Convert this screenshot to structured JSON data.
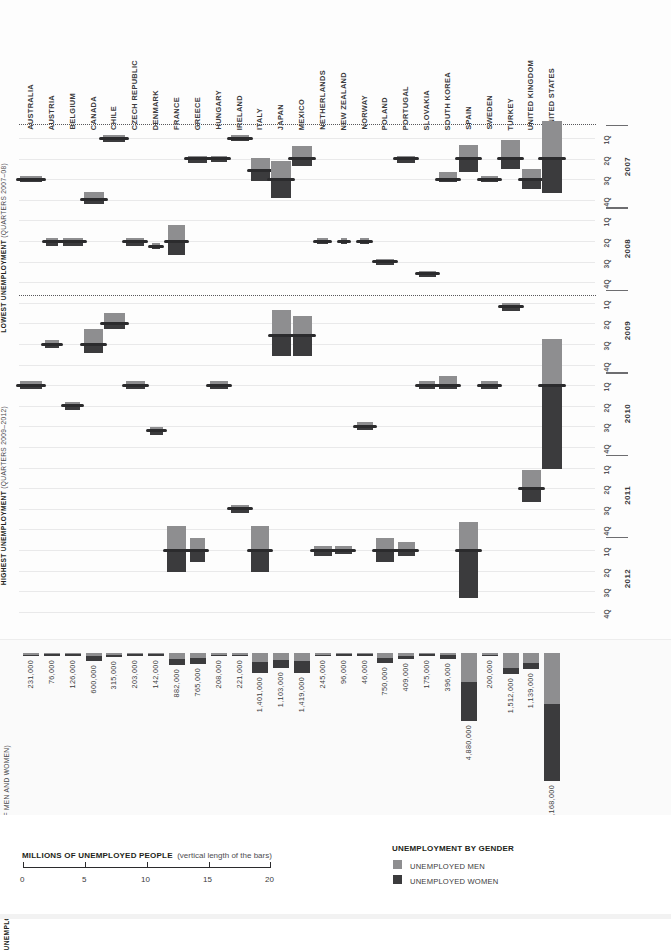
{
  "meta": {
    "colors": {
      "men": "#8e8e90",
      "women": "#3b3b3d",
      "grid": "#e9e9ea",
      "text": "#231f20"
    }
  },
  "left_captions": {
    "lowest_title": "LOWEST UNEMPLOYMENT",
    "lowest_sub": "(QUARTERS 2007–08)",
    "highest_title": "HIGHEST UNEMPLOYMENT",
    "highest_sub": "(QUARTERS 2009–2012)"
  },
  "countries": [
    "AUSTRALIA",
    "AUSTRIA",
    "BELGIUM",
    "CANADA",
    "CHILE",
    "CZECH REPUBLIC",
    "DENMARK",
    "FRANCE",
    "GREECE",
    "HUNGARY",
    "IRELAND",
    "ITALY",
    "JAPAN",
    "MEXICO",
    "NETHERLANDS",
    "NEW ZEALAND",
    "NORWAY",
    "POLAND",
    "PORTUGAL",
    "SLOVAKIA",
    "SOUTH KOREA",
    "SPAIN",
    "SWEDEN",
    "TURKEY",
    "UNITED KINGDOM",
    "UNITED STATES"
  ],
  "right_axis": {
    "quarters": [
      "1Q",
      "2Q",
      "3Q",
      "4Q"
    ],
    "years": [
      "2007",
      "2008",
      "2009",
      "2010",
      "2011",
      "2012"
    ]
  },
  "bottom_panel": {
    "title": "UNEMPLOYMENT INCREASE",
    "subtitle": "(TOTAL OF MEN AND WOMEN)"
  },
  "legend": {
    "scale_title": "MILLIONS OF UNEMPLOYED PEOPLE",
    "scale_note": "(vertical length of the bars)",
    "scale_ticks": [
      "0",
      "5",
      "10",
      "15",
      "20"
    ],
    "gender_title": "UNEMPLOYMENT BY GENDER",
    "men_label": "UNEMPLOYED MEN",
    "women_label": "UNEMPLOYED WOMEN"
  },
  "chart_data": {
    "type": "bar",
    "xlabel": "Country",
    "ylabel": "Millions of unemployed people (bar length)",
    "grid": true,
    "legend_position": "bottom-right",
    "unit": "people",
    "series": [
      {
        "name": "UNEMPLOYED MEN",
        "color": "#8e8e90"
      },
      {
        "name": "UNEMPLOYED WOMEN",
        "color": "#3b3b3d"
      }
    ],
    "categories": [
      "AUSTRALIA",
      "AUSTRIA",
      "BELGIUM",
      "CANADA",
      "CHILE",
      "CZECH REPUBLIC",
      "DENMARK",
      "FRANCE",
      "GREECE",
      "HUNGARY",
      "IRELAND",
      "ITALY",
      "JAPAN",
      "MEXICO",
      "NETHERLANDS",
      "NEW ZEALAND",
      "NORWAY",
      "POLAND",
      "PORTUGAL",
      "SLOVAKIA",
      "SOUTH KOREA",
      "SPAIN",
      "SWEDEN",
      "TURKEY",
      "UNITED KINGDOM",
      "UNITED STATES"
    ],
    "increase_total": [
      231000,
      76000,
      126000,
      600000,
      315000,
      203000,
      142000,
      882000,
      765000,
      208000,
      221000,
      1401000,
      1103000,
      1419000,
      245000,
      96000,
      46000,
      750000,
      409000,
      175000,
      396000,
      4880000,
      200000,
      1512000,
      1139000,
      9168000
    ],
    "increase_total_labels": [
      "231,000",
      "76,000",
      "126,000",
      "600,000",
      "315,000",
      "203,000",
      "142,000",
      "882,000",
      "765,000",
      "208,000",
      "221,000",
      "1,401,000",
      "1,103,000",
      "1,419,000",
      "245,000",
      "96,000",
      "46,000",
      "750,000",
      "409,000",
      "175,000",
      "396,000",
      "4,880,000",
      "200,000",
      "1,512,000",
      "1,139,000",
      "9,168,000"
    ],
    "lowest_quarter": [
      "3Q 2007",
      "2Q 2008",
      "2Q 2008",
      "4Q 2007",
      "1Q 2007",
      "2Q 2008",
      "3Q 2008",
      "2Q 2008",
      "2Q 2007",
      "2Q 2007",
      "4Q 2007",
      "2Q 2007",
      "4Q 2007",
      "3Q 2007",
      "4Q 2008",
      "4Q 2007",
      "3Q 2008",
      "4Q 2008",
      "2Q 2007",
      "4Q 2008",
      "4Q 2007",
      "2Q 2007",
      "4Q 2007",
      "2Q 2007",
      "1Q 2008",
      "2Q 2007"
    ],
    "highest_quarter": [
      "1Q 2010",
      "2Q 2009",
      "1Q 2010",
      "3Q 2009",
      "3Q 2009",
      "1Q 2010",
      "2Q 2010",
      "1Q 2012",
      "1Q 2012",
      "1Q 2010",
      "3Q 2011",
      "1Q 2012",
      "3Q 2009",
      "3Q 2009",
      "1Q 2012",
      "1Q 2012",
      "2Q 2010",
      "1Q 2012",
      "1Q 2012",
      "1Q 2010",
      "1Q 2010",
      "1Q 2012",
      "1Q 2010",
      "1Q 2009",
      "3Q 2011",
      "4Q 2009"
    ],
    "ylim_scale_millions": [
      0,
      20
    ]
  }
}
